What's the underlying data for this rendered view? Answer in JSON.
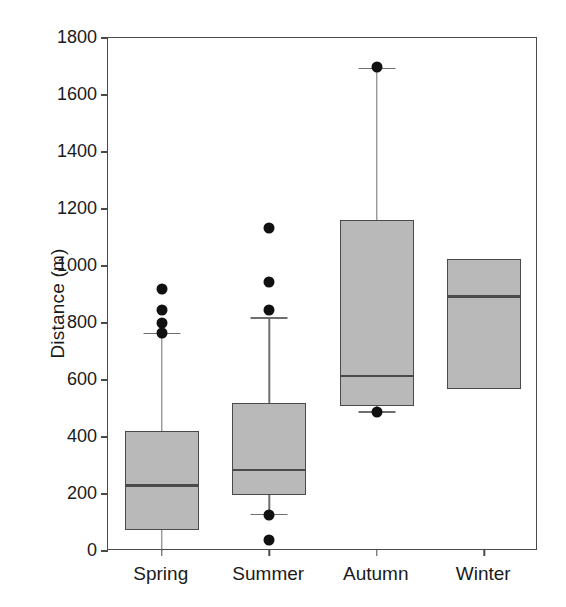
{
  "chart_data": {
    "type": "box",
    "title": "",
    "xlabel": "",
    "ylabel": "Distance (m)",
    "ylim": [
      0,
      1800
    ],
    "ytick_step": 200,
    "yticks": [
      0,
      200,
      400,
      600,
      800,
      1000,
      1200,
      1400,
      1600,
      1800
    ],
    "ytick_labels": [
      "0",
      "200",
      "400",
      "600",
      "800",
      "1000",
      "1200",
      "1400",
      "1600",
      "1800"
    ],
    "categories": [
      "Spring",
      "Summer",
      "Autumn",
      "Winter"
    ],
    "grid": false,
    "legend": null,
    "box_fill": "#b9b9b9",
    "line_color": "#4a4a4a",
    "outlier_color": "#111111",
    "boxes": [
      {
        "name": "Spring",
        "q1": 75,
        "median": 230,
        "q3": 420,
        "whisker_low": 0,
        "whisker_high": 765,
        "outliers": [
          765,
          800,
          845,
          920
        ]
      },
      {
        "name": "Summer",
        "q1": 195,
        "median": 283,
        "q3": 520,
        "whisker_low": 130,
        "whisker_high": 820,
        "outliers": [
          40,
          125,
          845,
          945,
          1135
        ]
      },
      {
        "name": "Autumn",
        "q1": 510,
        "median": 615,
        "q3": 1160,
        "whisker_low": 490,
        "whisker_high": 1695,
        "outliers": [
          488,
          1700
        ]
      },
      {
        "name": "Winter",
        "q1": 570,
        "median": 893,
        "q3": 1025,
        "whisker_low": null,
        "whisker_high": null,
        "outliers": []
      }
    ]
  }
}
